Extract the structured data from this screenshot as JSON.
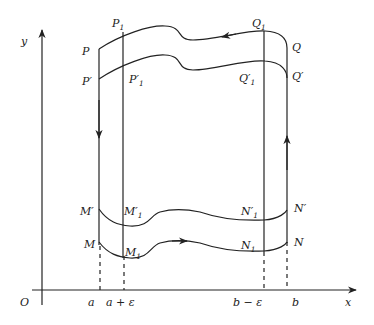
{
  "diagram": {
    "title": "",
    "axes": {
      "x_label": "x",
      "y_label": "y",
      "origin_label": "O"
    },
    "x_ticks": [
      {
        "id": "a",
        "label": "a"
      },
      {
        "id": "a_eps",
        "label": "a + ε"
      },
      {
        "id": "b_eps",
        "label": "b − ε"
      },
      {
        "id": "b",
        "label": "b"
      }
    ],
    "points": {
      "P": {
        "base": "P",
        "prime": "",
        "sub": ""
      },
      "P1": {
        "base": "P",
        "prime": "",
        "sub": "1"
      },
      "Pp": {
        "base": "P",
        "prime": "′",
        "sub": ""
      },
      "P1p": {
        "base": "P",
        "prime": "′",
        "sub": "1"
      },
      "Q": {
        "base": "Q",
        "prime": "",
        "sub": ""
      },
      "Q1": {
        "base": "Q",
        "prime": "",
        "sub": "1"
      },
      "Qp": {
        "base": "Q",
        "prime": "′",
        "sub": ""
      },
      "Q1p": {
        "base": "Q",
        "prime": "′",
        "sub": "1"
      },
      "M": {
        "base": "M",
        "prime": "",
        "sub": ""
      },
      "M1": {
        "base": "M",
        "prime": "",
        "sub": "1"
      },
      "Mp": {
        "base": "M",
        "prime": "′",
        "sub": ""
      },
      "M1p": {
        "base": "M",
        "prime": "′",
        "sub": "1"
      },
      "N": {
        "base": "N",
        "prime": "",
        "sub": ""
      },
      "N1": {
        "base": "N",
        "prime": "",
        "sub": "1"
      },
      "Np": {
        "base": "N",
        "prime": "′",
        "sub": ""
      },
      "N1p": {
        "base": "N",
        "prime": "′",
        "sub": "1"
      }
    },
    "curves": [
      {
        "name": "outer-top-curve",
        "from": "Q",
        "to": "P",
        "direction": "right-to-left"
      },
      {
        "name": "inner-top-curve",
        "from": "Q′",
        "to": "P′"
      },
      {
        "name": "inner-bottom-curve",
        "from": "M′",
        "to": "N′"
      },
      {
        "name": "outer-bottom-curve",
        "from": "M",
        "to": "N",
        "direction": "left-to-right"
      },
      {
        "name": "left-side",
        "from": "P",
        "to": "M",
        "direction": "downward"
      },
      {
        "name": "right-side",
        "from": "N",
        "to": "Q",
        "direction": "upward"
      }
    ],
    "stroke_color": "#222222",
    "background": "#ffffff"
  }
}
